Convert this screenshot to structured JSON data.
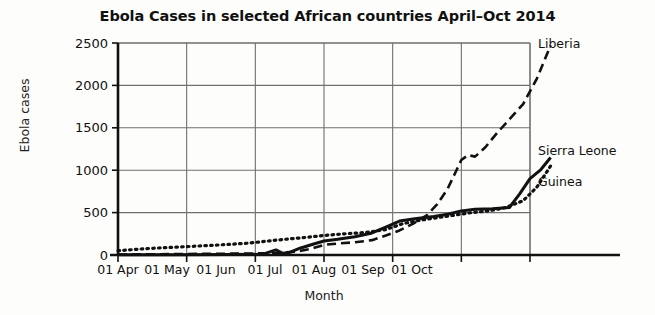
{
  "chart_data": {
    "type": "line",
    "title": "Ebola Cases in selected African countries April–Oct 2014",
    "xlabel": "Month",
    "ylabel": "Ebola cases",
    "xlim": [
      0,
      6
    ],
    "ylim": [
      0,
      2500
    ],
    "grid": true,
    "legend_position": "right-inline-labels",
    "categories": [
      "01 Apr",
      "01 May",
      "01 Jun",
      "01 Jul",
      "01 Aug",
      "01 Sep",
      "01 Oct"
    ],
    "yticks": [
      0,
      500,
      1000,
      1500,
      2000,
      2500
    ],
    "series": [
      {
        "name": "Liberia",
        "style": "dashed",
        "color": "#111111",
        "x": [
          0.0,
          0.5,
          1.0,
          1.5,
          2.0,
          2.35,
          2.6,
          2.8,
          3.0,
          3.2,
          3.45,
          3.7,
          3.9,
          4.1,
          4.3,
          4.5,
          4.65,
          4.8,
          4.9,
          5.0,
          5.1,
          5.2,
          5.35,
          5.5,
          5.7,
          5.9,
          6.1,
          6.3
        ],
        "values": [
          5,
          8,
          12,
          15,
          18,
          25,
          40,
          70,
          120,
          135,
          150,
          175,
          230,
          290,
          370,
          470,
          600,
          780,
          950,
          1120,
          1180,
          1160,
          1270,
          1420,
          1600,
          1780,
          2080,
          2470
        ]
      },
      {
        "name": "Sierra Leone",
        "style": "solid",
        "color": "#111111",
        "x": [
          0.0,
          0.8,
          1.6,
          2.1,
          2.3,
          2.4,
          2.5,
          2.65,
          2.85,
          3.0,
          3.2,
          3.45,
          3.7,
          3.9,
          4.1,
          4.35,
          4.6,
          4.8,
          5.0,
          5.2,
          5.45,
          5.7,
          5.85,
          6.0,
          6.15,
          6.3
        ],
        "values": [
          2,
          3,
          5,
          8,
          60,
          20,
          30,
          80,
          130,
          165,
          185,
          215,
          260,
          330,
          400,
          430,
          455,
          480,
          520,
          540,
          545,
          560,
          720,
          900,
          1000,
          1150
        ]
      },
      {
        "name": "Guinea",
        "style": "dotted",
        "color": "#111111",
        "x": [
          0.0,
          0.4,
          0.9,
          1.4,
          1.9,
          2.3,
          2.7,
          3.0,
          3.3,
          3.6,
          3.9,
          4.15,
          4.4,
          4.65,
          4.9,
          5.15,
          5.4,
          5.65,
          5.9,
          6.1,
          6.3
        ],
        "values": [
          50,
          75,
          95,
          115,
          140,
          175,
          205,
          230,
          250,
          265,
          300,
          370,
          410,
          440,
          470,
          500,
          520,
          560,
          640,
          800,
          1050
        ]
      }
    ]
  },
  "axes": {
    "y_tick_labels": [
      "2500",
      "2000",
      "1500",
      "1000",
      "500",
      "0"
    ],
    "x_tick_labels": [
      "01 Apr",
      "01 May",
      "01 Jun",
      "01 Jul",
      "01 Aug",
      "01 Sep",
      "01 Oct"
    ]
  },
  "series_labels": {
    "liberia": "Liberia",
    "sierra_leone": "Sierra Leone",
    "guinea": "Guinea"
  },
  "colors": {
    "ink": "#111111",
    "grid": "#6f6f6f",
    "background": "#fdfdfb"
  }
}
